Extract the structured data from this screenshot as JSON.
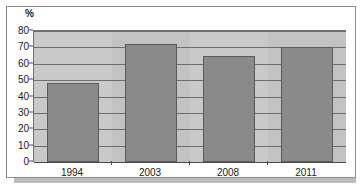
{
  "chart_data": {
    "type": "bar",
    "title": "",
    "subtitle": "",
    "xlabel": "",
    "ylabel": "%",
    "categories": [
      "1994",
      "2003",
      "2008",
      "2011"
    ],
    "values": [
      48,
      72,
      65,
      70
    ],
    "ylim": [
      0,
      80
    ],
    "yticks": [
      0,
      10,
      20,
      30,
      40,
      50,
      60,
      70,
      80
    ],
    "ytick_labels": [
      "0",
      "10",
      "20",
      "30",
      "40",
      "50",
      "60",
      "70",
      "80"
    ],
    "grid": true,
    "legend": false,
    "legend_position": "none",
    "annotations": [],
    "colors": {
      "bar_fill": "#8a8a8a",
      "bar_border": "#5a5a5a",
      "plot_background": "#c9c9c9",
      "gridline": "#6e6e6e",
      "axis": "#4a4a4a",
      "frame_border": "#8d8d8d",
      "shadow": "#bdbdbd",
      "text": "#1a1a1a",
      "page_background": "#ffffff"
    }
  }
}
